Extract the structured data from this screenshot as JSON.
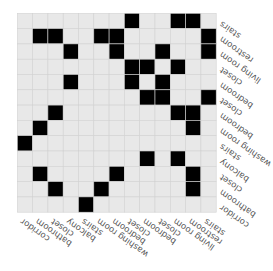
{
  "chart_data": {
    "type": "heatmap",
    "title": "",
    "rotation_deg": 180,
    "row_labels": [
      "stairs",
      "restroom",
      "living room",
      "closet",
      "bedroom",
      "closet",
      "bedroom",
      "washing room",
      "stairs",
      "balcony",
      "closet",
      "bathroom",
      "corridor"
    ],
    "col_labels": [
      "corridor",
      "bathroom",
      "closet",
      "balcony",
      "stairs",
      "washing room",
      "bedroom",
      "closet",
      "bedroom",
      "closet",
      "living room",
      "restroom",
      "stairs"
    ],
    "filled_cells_by_row": [
      [
        7,
        10,
        11
      ],
      [
        1,
        2,
        5,
        6,
        12
      ],
      [
        3,
        6,
        9,
        12
      ],
      [
        7,
        8,
        10
      ],
      [
        3,
        7,
        9
      ],
      [
        8,
        9,
        12
      ],
      [
        2,
        10,
        11
      ],
      [
        1,
        11
      ],
      [
        0
      ],
      [
        8,
        10
      ],
      [
        1,
        6,
        11
      ],
      [
        2,
        5,
        11
      ],
      [
        4
      ]
    ],
    "values_legend": {
      "0": "empty",
      "1": "filled"
    },
    "colors": {
      "empty": "#e8e8e8",
      "filled": "#000000",
      "grid": "#d2d2d2",
      "text": "#555555"
    },
    "grid": true
  }
}
